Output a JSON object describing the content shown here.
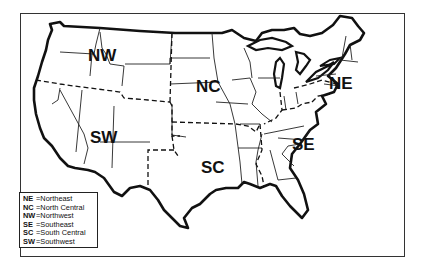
{
  "map": {
    "title": "United States regions",
    "region_labels": [
      {
        "code": "NW",
        "x": 90,
        "y": 61
      },
      {
        "code": "NC",
        "x": 199,
        "y": 92
      },
      {
        "code": "NE",
        "x": 330,
        "y": 88
      },
      {
        "code": "SW",
        "x": 90,
        "y": 143
      },
      {
        "code": "SC",
        "x": 201,
        "y": 172
      },
      {
        "code": "SE",
        "x": 292,
        "y": 150
      }
    ]
  },
  "legend": {
    "items": [
      {
        "abbr": "NE",
        "sep": "=",
        "name": "Northeast"
      },
      {
        "abbr": "NC",
        "sep": "=",
        "name": "North Central"
      },
      {
        "abbr": "NW",
        "sep": "=",
        "name": "Northwest"
      },
      {
        "abbr": "SE",
        "sep": "=",
        "name": "Southeast"
      },
      {
        "abbr": "SC",
        "sep": "=",
        "name": "South Central"
      },
      {
        "abbr": "SW",
        "sep": "=",
        "name": "Southwest"
      }
    ]
  },
  "colors": {
    "ink": "#111111",
    "background": "#ffffff"
  }
}
